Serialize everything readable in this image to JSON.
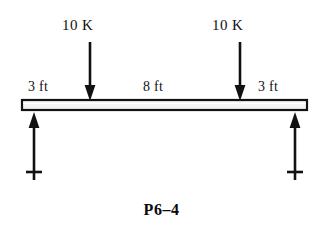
{
  "figure": {
    "caption": "P6–4",
    "background_color": "#ffffff",
    "ink_color": "#111111"
  },
  "beam": {
    "fill_color": "#f2f2f2",
    "edge_color": "#111111",
    "left_x": 22,
    "right_x": 307,
    "top_y": 100,
    "bottom_y": 110
  },
  "loads": [
    {
      "name": "load-left",
      "label": "10 K",
      "magnitude": 10,
      "unit": "K",
      "direction": "down",
      "x": 90
    },
    {
      "name": "load-right",
      "label": "10 K",
      "magnitude": 10,
      "unit": "K",
      "direction": "down",
      "x": 240
    }
  ],
  "reactions": [
    {
      "name": "reaction-left",
      "direction": "up",
      "x": 34
    },
    {
      "name": "reaction-right",
      "direction": "up",
      "x": 295
    }
  ],
  "dimensions": [
    {
      "name": "dim-left",
      "label": "3 ft",
      "value": 3,
      "unit": "ft"
    },
    {
      "name": "dim-middle",
      "label": "8 ft",
      "value": 8,
      "unit": "ft"
    },
    {
      "name": "dim-right",
      "label": "3 ft",
      "value": 3,
      "unit": "ft"
    }
  ]
}
